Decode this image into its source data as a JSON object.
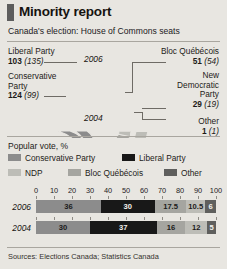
{
  "header": {
    "title": "Minority report",
    "subtitle": "Canada's election: House of Commons seats",
    "tab_mark": "red-tab-mark"
  },
  "colors": {
    "background": "#e8e6e1",
    "conservative": "#8c8c8c",
    "liberal": "#181818",
    "ndp": "#bdbdb7",
    "bloc": "#a5a5a0",
    "other": "#5f5f5d",
    "rule": "#a9a69f",
    "leader_line": "#6e6b65"
  },
  "seat_chart": {
    "type": "pie",
    "outer_year": "2006",
    "inner_year": "2004",
    "labels": {
      "liberal": {
        "name": "Liberal Party",
        "seats_2006": "103",
        "seats_2004": "(135)"
      },
      "conservative": {
        "name": "Conservative Party",
        "name_line1": "Conservative",
        "name_line2": "Party",
        "seats_2006": "124",
        "seats_2004": "(99)"
      },
      "bloc": {
        "name": "Bloc Québécois",
        "seats_2006": "51",
        "seats_2004": "(54)"
      },
      "ndp": {
        "name": "New Democratic Party",
        "name_line1": "New",
        "name_line2": "Democratic",
        "name_line3": "Party",
        "seats_2006": "29",
        "seats_2004": "(19)"
      },
      "other": {
        "name": "Other",
        "seats_2006": "1",
        "seats_2004": "(1)"
      }
    },
    "series": [
      {
        "name": "2006",
        "values": [
          124,
          103,
          51,
          29,
          1
        ]
      },
      {
        "name": "2004",
        "values": [
          99,
          135,
          54,
          19,
          1
        ]
      }
    ],
    "categories": [
      "Conservative Party",
      "Liberal Party",
      "Bloc Québécois",
      "New Democratic Party",
      "Other"
    ]
  },
  "popular_vote": {
    "title": "Popular vote, %",
    "legend": [
      {
        "key": "conservative",
        "label": "Conservative Party"
      },
      {
        "key": "liberal",
        "label": "Liberal Party"
      },
      {
        "key": "ndp",
        "label": "NDP"
      },
      {
        "key": "bloc",
        "label": "Bloc Québécois"
      },
      {
        "key": "other",
        "label": "Other"
      }
    ],
    "axis_ticks": [
      "0",
      "10",
      "20",
      "30",
      "40",
      "50",
      "60",
      "70",
      "80",
      "90",
      "100"
    ],
    "rows": [
      {
        "year": "2006",
        "values": [
          "36",
          "30",
          "17.5",
          "10.5",
          "6"
        ]
      },
      {
        "year": "2004",
        "values": [
          "30",
          "37",
          "16",
          "12",
          "5"
        ]
      }
    ]
  },
  "chart_data": {
    "type": "bar",
    "title": "Popular vote, %",
    "xlabel": "",
    "ylabel": "",
    "xlim": [
      0,
      100
    ],
    "grid": false,
    "legend_position": "top",
    "categories": [
      "2006",
      "2004"
    ],
    "series": [
      {
        "name": "Conservative Party",
        "values": [
          36,
          30
        ]
      },
      {
        "name": "Liberal Party",
        "values": [
          30,
          37
        ]
      },
      {
        "name": "NDP",
        "values": [
          17.5,
          16
        ]
      },
      {
        "name": "Bloc Québécois",
        "values": [
          10.5,
          12
        ]
      },
      {
        "name": "Other",
        "values": [
          6,
          5
        ]
      }
    ]
  },
  "source": "Sources: Elections Canada; Statistics Canada"
}
